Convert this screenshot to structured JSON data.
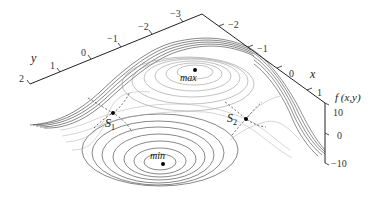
{
  "figure": {
    "type": "3d-surface-contour",
    "axes": {
      "y": {
        "name": "y",
        "ticks": [
          "2",
          "1",
          "0",
          "−1",
          "−2",
          "−3"
        ]
      },
      "x": {
        "name": "x",
        "ticks": [
          "−2",
          "−1",
          "0",
          "1"
        ]
      },
      "f": {
        "name": "f (x,y)",
        "ticks": [
          "10",
          "0",
          "−10"
        ]
      }
    },
    "points": {
      "max": {
        "label": "max"
      },
      "min": {
        "label": "min"
      },
      "s1": {
        "label": "S",
        "sub": "1"
      },
      "s2": {
        "label": "S",
        "sub": "2"
      }
    },
    "colors": {
      "axis": "#222222",
      "contour": "#7a7a7a",
      "dense_edge": "#111111",
      "separatrix": "#333333",
      "background": "#ffffff"
    }
  }
}
